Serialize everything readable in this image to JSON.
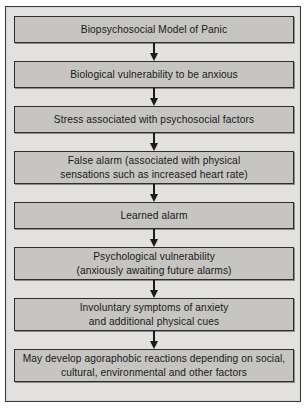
{
  "diagram": {
    "title": "Biopsychosocial Model of Panic",
    "colors": {
      "frame_background": "#e2e1df",
      "frame_border": "#3a3a38",
      "node_fill": "#c6c5c2",
      "node_border": "#2e2e2c",
      "arrow": "#1b1b1b",
      "text": "#18181a"
    },
    "nodes": [
      {
        "id": "biopsychosocial-model-of-panic",
        "lines": [
          "Biopsychosocial Model of Panic"
        ]
      },
      {
        "id": "biological-vulnerability",
        "lines": [
          "Biological vulnerability to be anxious"
        ]
      },
      {
        "id": "stress-psychosocial-factors",
        "lines": [
          "Stress associated with psychosocial factors"
        ]
      },
      {
        "id": "false-alarm",
        "lines": [
          "False alarm (associated with physical",
          "sensations such as increased heart rate)"
        ]
      },
      {
        "id": "learned-alarm",
        "lines": [
          "Learned alarm"
        ]
      },
      {
        "id": "psychological-vulnerability",
        "lines": [
          "Psychological vulnerability",
          "(anxiously awaiting future alarms)"
        ]
      },
      {
        "id": "involuntary-symptoms",
        "lines": [
          "Involuntary symptoms of anxiety",
          "and additional physical cues"
        ]
      },
      {
        "id": "agoraphobic-reactions",
        "lines": [
          "May develop agoraphobic reactions depending on social,",
          "cultural, environmental and other factors"
        ]
      }
    ],
    "arrow_count": 7
  }
}
